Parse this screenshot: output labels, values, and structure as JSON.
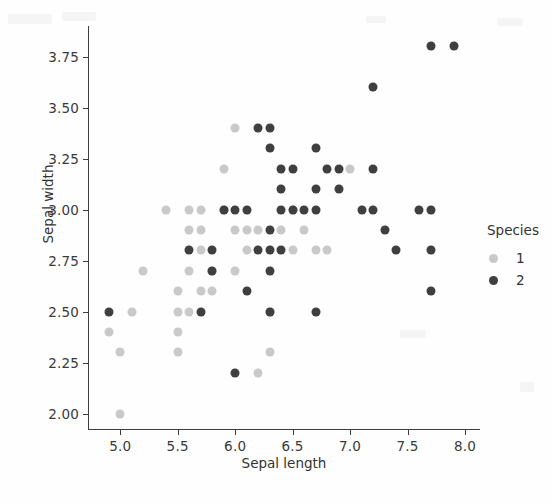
{
  "figure": {
    "background": "#fefefe",
    "width": 552,
    "height": 504
  },
  "axes": {
    "xlabel": "Sepal length",
    "ylabel": "Sepal width",
    "xticks": [
      "5.0",
      "5.5",
      "6.0",
      "6.5",
      "7.0",
      "7.5",
      "8.0"
    ],
    "yticks": [
      "2.00",
      "2.25",
      "2.50",
      "2.75",
      "3.00",
      "3.25",
      "3.50",
      "3.75"
    ],
    "xlim": [
      4.72,
      8.13
    ],
    "ylim": [
      1.92,
      3.9
    ],
    "grid": false,
    "spine_color": "#3d3d3d"
  },
  "legend": {
    "title": "Species",
    "position": "right",
    "entries": [
      {
        "label": "1",
        "color": "#c9c9c9"
      },
      {
        "label": "2",
        "color": "#3f3f3f"
      }
    ]
  },
  "chart_data": {
    "type": "scatter",
    "title": "",
    "xlabel": "Sepal length",
    "ylabel": "Sepal width",
    "xlim": [
      4.72,
      8.13
    ],
    "ylim": [
      1.92,
      3.9
    ],
    "grid": false,
    "legend_title": "Species",
    "legend_position": "right",
    "marker_size_px": 9,
    "series": [
      {
        "name": "1",
        "color": "#c9c9c9",
        "points": [
          [
            5.1,
            2.5
          ],
          [
            4.9,
            2.4
          ],
          [
            5.0,
            2.3
          ],
          [
            5.0,
            2.0
          ],
          [
            5.2,
            2.7
          ],
          [
            5.4,
            3.0
          ],
          [
            5.5,
            2.5
          ],
          [
            5.5,
            2.4
          ],
          [
            5.5,
            2.3
          ],
          [
            5.5,
            2.6
          ],
          [
            5.6,
            3.0
          ],
          [
            5.6,
            2.9
          ],
          [
            5.6,
            2.7
          ],
          [
            5.6,
            2.5
          ],
          [
            5.7,
            3.0
          ],
          [
            5.7,
            2.9
          ],
          [
            5.7,
            2.8
          ],
          [
            5.7,
            2.6
          ],
          [
            5.8,
            2.6
          ],
          [
            5.8,
            2.7
          ],
          [
            5.9,
            3.2
          ],
          [
            5.9,
            3.0
          ],
          [
            6.0,
            3.4
          ],
          [
            6.0,
            2.9
          ],
          [
            6.0,
            2.7
          ],
          [
            6.1,
            2.9
          ],
          [
            6.1,
            2.8
          ],
          [
            6.2,
            2.9
          ],
          [
            6.2,
            2.2
          ],
          [
            6.3,
            2.5
          ],
          [
            6.3,
            2.3
          ],
          [
            6.4,
            2.9
          ],
          [
            6.5,
            3.0
          ],
          [
            6.5,
            2.8
          ],
          [
            6.6,
            2.9
          ],
          [
            6.7,
            2.8
          ],
          [
            6.8,
            2.8
          ],
          [
            7.0,
            3.2
          ]
        ]
      },
      {
        "name": "2",
        "color": "#3f3f3f",
        "points": [
          [
            4.9,
            2.5
          ],
          [
            5.6,
            2.8
          ],
          [
            5.7,
            2.5
          ],
          [
            5.8,
            2.8
          ],
          [
            5.8,
            2.7
          ],
          [
            5.9,
            3.0
          ],
          [
            6.0,
            3.0
          ],
          [
            6.0,
            2.2
          ],
          [
            6.1,
            3.0
          ],
          [
            6.1,
            2.6
          ],
          [
            6.2,
            3.4
          ],
          [
            6.2,
            2.8
          ],
          [
            6.3,
            3.4
          ],
          [
            6.3,
            3.3
          ],
          [
            6.3,
            2.9
          ],
          [
            6.3,
            2.8
          ],
          [
            6.3,
            2.7
          ],
          [
            6.3,
            2.5
          ],
          [
            6.4,
            3.2
          ],
          [
            6.4,
            3.1
          ],
          [
            6.4,
            2.8
          ],
          [
            6.4,
            3.0
          ],
          [
            6.5,
            3.2
          ],
          [
            6.5,
            3.0
          ],
          [
            6.6,
            3.0
          ],
          [
            6.7,
            3.3
          ],
          [
            6.7,
            3.1
          ],
          [
            6.7,
            3.0
          ],
          [
            6.7,
            2.5
          ],
          [
            6.8,
            3.2
          ],
          [
            6.9,
            3.2
          ],
          [
            6.9,
            3.1
          ],
          [
            7.1,
            3.0
          ],
          [
            7.2,
            3.6
          ],
          [
            7.2,
            3.2
          ],
          [
            7.2,
            3.0
          ],
          [
            7.3,
            2.9
          ],
          [
            7.4,
            2.8
          ],
          [
            7.6,
            3.0
          ],
          [
            7.7,
            3.8
          ],
          [
            7.7,
            3.0
          ],
          [
            7.7,
            2.8
          ],
          [
            7.7,
            2.6
          ],
          [
            7.9,
            3.8
          ]
        ]
      }
    ]
  }
}
